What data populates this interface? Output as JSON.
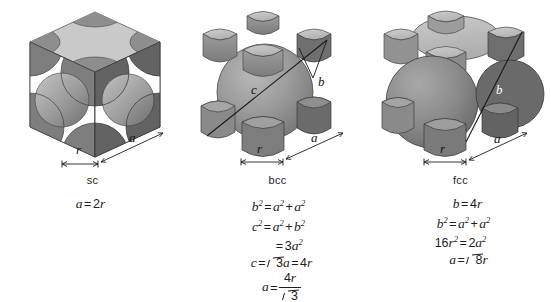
{
  "figure": {
    "background_color": "#ffffff",
    "ink_color": "#1d1d1d"
  },
  "palette": {
    "top_face": "#c9c9c9",
    "front_face": "#8d8d8d",
    "side_face": "#6f6f6f",
    "sphere_light": "#b4b4b4",
    "sphere_mid": "#949494",
    "sphere_dark": "#6a6a6a",
    "void_white": "#ffffff",
    "outline": "#3a3a3a"
  },
  "cells": [
    {
      "id": "sc",
      "label": "sc",
      "name": "simple-cubic",
      "dimensions": [
        {
          "symbol": "r",
          "name": "radius-dimension"
        },
        {
          "symbol": "a",
          "name": "edge-dimension"
        }
      ],
      "equations": [
        {
          "id": "sc-eq-1",
          "parts": [
            {
              "t": "var",
              "v": "a"
            },
            {
              "t": "op",
              "v": "="
            },
            {
              "t": "num",
              "v": "2"
            },
            {
              "t": "var",
              "v": "r"
            }
          ]
        }
      ]
    },
    {
      "id": "bcc",
      "label": "bcc",
      "name": "body-centered-cubic",
      "dimensions": [
        {
          "symbol": "r",
          "name": "radius-dimension"
        },
        {
          "symbol": "a",
          "name": "edge-dimension"
        },
        {
          "symbol": "b",
          "name": "face-diagonal-label"
        },
        {
          "symbol": "c",
          "name": "body-diagonal-label"
        }
      ],
      "equations": [
        {
          "id": "bcc-eq-1",
          "parts": [
            {
              "t": "var",
              "v": "b"
            },
            {
              "t": "sup",
              "v": "2"
            },
            {
              "t": "op",
              "v": "="
            },
            {
              "t": "var",
              "v": "a"
            },
            {
              "t": "sup",
              "v": "2"
            },
            {
              "t": "op",
              "v": "+"
            },
            {
              "t": "var",
              "v": "a"
            },
            {
              "t": "sup",
              "v": "2"
            }
          ]
        },
        {
          "id": "bcc-eq-2",
          "parts": [
            {
              "t": "var",
              "v": "c"
            },
            {
              "t": "sup",
              "v": "2"
            },
            {
              "t": "op",
              "v": "="
            },
            {
              "t": "var",
              "v": "a"
            },
            {
              "t": "sup",
              "v": "2"
            },
            {
              "t": "op",
              "v": "+"
            },
            {
              "t": "var",
              "v": "b"
            },
            {
              "t": "sup",
              "v": "2"
            }
          ]
        },
        {
          "id": "bcc-eq-3",
          "parts": [
            {
              "t": "op",
              "v": "="
            },
            {
              "t": "num",
              "v": "3"
            },
            {
              "t": "var",
              "v": "a"
            },
            {
              "t": "sup",
              "v": "2"
            }
          ],
          "indent": 22
        },
        {
          "id": "bcc-eq-4",
          "parts": [
            {
              "t": "var",
              "v": "c"
            },
            {
              "t": "op",
              "v": "="
            },
            {
              "t": "sqrt",
              "v": "3"
            },
            {
              "t": "var",
              "v": "a"
            },
            {
              "t": "op",
              "v": "="
            },
            {
              "t": "num",
              "v": "4"
            },
            {
              "t": "var",
              "v": "r"
            }
          ],
          "indent": 8
        },
        {
          "id": "bcc-eq-5",
          "parts": [
            {
              "t": "var",
              "v": "a"
            },
            {
              "t": "op",
              "v": "="
            },
            {
              "t": "frac",
              "num": "4r",
              "den": "sqrt3"
            }
          ],
          "indent": 8
        }
      ]
    },
    {
      "id": "fcc",
      "label": "fcc",
      "name": "face-centered-cubic",
      "dimensions": [
        {
          "symbol": "r",
          "name": "radius-dimension"
        },
        {
          "symbol": "a",
          "name": "edge-dimension"
        },
        {
          "symbol": "b",
          "name": "face-diagonal-label"
        }
      ],
      "equations": [
        {
          "id": "fcc-eq-1",
          "parts": [
            {
              "t": "var",
              "v": "b"
            },
            {
              "t": "op",
              "v": "="
            },
            {
              "t": "num",
              "v": "4"
            },
            {
              "t": "var",
              "v": "r"
            }
          ],
          "indent": 14
        },
        {
          "id": "fcc-eq-2",
          "parts": [
            {
              "t": "var",
              "v": "b"
            },
            {
              "t": "sup",
              "v": "2"
            },
            {
              "t": "op",
              "v": "="
            },
            {
              "t": "var",
              "v": "a"
            },
            {
              "t": "sup",
              "v": "2"
            },
            {
              "t": "op",
              "v": "+"
            },
            {
              "t": "var",
              "v": "a"
            },
            {
              "t": "sup",
              "v": "2"
            }
          ],
          "indent": 6
        },
        {
          "id": "fcc-eq-3",
          "parts": [
            {
              "t": "num",
              "v": "16"
            },
            {
              "t": "var",
              "v": "r"
            },
            {
              "t": "sup",
              "v": "2"
            },
            {
              "t": "op",
              "v": "="
            },
            {
              "t": "num",
              "v": "2"
            },
            {
              "t": "var",
              "v": "a"
            },
            {
              "t": "sup",
              "v": "2"
            }
          ]
        },
        {
          "id": "fcc-eq-4",
          "parts": [
            {
              "t": "var",
              "v": "a"
            },
            {
              "t": "op",
              "v": "="
            },
            {
              "t": "sqrt",
              "v": "8"
            },
            {
              "t": "var",
              "v": "r"
            }
          ],
          "indent": 16
        }
      ]
    }
  ]
}
